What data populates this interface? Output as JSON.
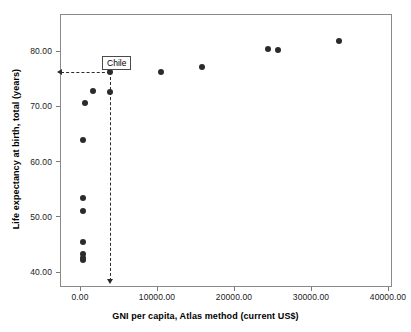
{
  "chart_data": {
    "type": "scatter",
    "title": "",
    "xlabel": "GNI per capita, Atlas method (current US$)",
    "ylabel": "Life expectancy at birth, total (years)",
    "xlim": [
      -2600,
      41500
    ],
    "ylim": [
      38.0,
      86.5
    ],
    "grid": false,
    "legend": null,
    "xticks": [
      0,
      10000,
      20000,
      30000,
      40000
    ],
    "xtick_labels": [
      "0.00",
      "10000.00",
      "20000.00",
      "30000.00",
      "40000.00"
    ],
    "yticks": [
      40,
      50,
      60,
      70,
      80
    ],
    "ytick_labels": [
      "40.00",
      "50.00",
      "60.00",
      "70.00",
      "80.00"
    ],
    "points": [
      {
        "x": 390,
        "y": 42.1
      },
      {
        "x": 420,
        "y": 42.6
      },
      {
        "x": 430,
        "y": 43.2
      },
      {
        "x": 390,
        "y": 45.4
      },
      {
        "x": 360,
        "y": 51.0
      },
      {
        "x": 350,
        "y": 53.4
      },
      {
        "x": 400,
        "y": 63.8
      },
      {
        "x": 700,
        "y": 70.5
      },
      {
        "x": 1650,
        "y": 72.7
      },
      {
        "x": 3900,
        "y": 72.5
      },
      {
        "x": 3900,
        "y": 76.2
      },
      {
        "x": 10500,
        "y": 76.1
      },
      {
        "x": 15800,
        "y": 77.0
      },
      {
        "x": 24400,
        "y": 80.2
      },
      {
        "x": 25700,
        "y": 80.1
      },
      {
        "x": 33700,
        "y": 81.8
      }
    ],
    "annotation": {
      "label": "Chile",
      "point_x": 3900,
      "point_y": 76.2,
      "guide_to_y_axis": true,
      "guide_to_x_axis": true
    }
  }
}
